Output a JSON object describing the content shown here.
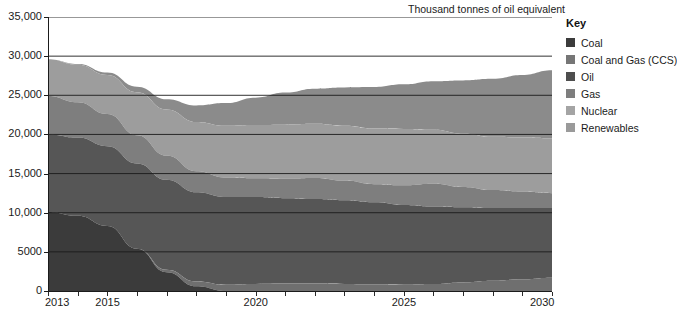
{
  "chart_data": {
    "type": "area",
    "stacked": true,
    "title": "Thousand tonnes of oil equivalent",
    "xlabel": "",
    "ylabel": "",
    "xlim": [
      2013,
      2030
    ],
    "ylim": [
      0,
      35000
    ],
    "ytick_labels": [
      "0",
      "5000",
      "10,000",
      "15,000",
      "20,000",
      "25,000",
      "30,000",
      "35,000"
    ],
    "ytick_values": [
      0,
      5000,
      10000,
      15000,
      20000,
      25000,
      30000,
      35000
    ],
    "xtick_labels": [
      "2013",
      "2015",
      "2020",
      "2025",
      "2030"
    ],
    "xtick_values": [
      2013,
      2015,
      2020,
      2025,
      2030
    ],
    "grid": true,
    "legend_position": "right",
    "legend_title": "Key",
    "x": [
      2013,
      2014,
      2015,
      2016,
      2017,
      2018,
      2019,
      2020,
      2021,
      2022,
      2023,
      2024,
      2025,
      2026,
      2027,
      2028,
      2029,
      2030
    ],
    "series": [
      {
        "name": "Coal",
        "color": "#3b3b3b",
        "values": [
          10100,
          9600,
          8300,
          5400,
          2400,
          600,
          0,
          0,
          0,
          0,
          0,
          0,
          0,
          0,
          0,
          0,
          0,
          0
        ]
      },
      {
        "name": "Coal and Gas (CCS)",
        "color": "#6f6f6f",
        "values": [
          0,
          0,
          0,
          0,
          300,
          600,
          800,
          900,
          950,
          950,
          900,
          850,
          800,
          900,
          1100,
          1300,
          1500,
          1700
        ]
      },
      {
        "name": "Oil",
        "color": "#565656",
        "values": [
          9900,
          10000,
          10200,
          10900,
          11500,
          11400,
          11200,
          11100,
          10900,
          10800,
          10700,
          10500,
          10200,
          9900,
          9600,
          9300,
          9100,
          8900
        ]
      },
      {
        "name": "Gas",
        "color": "#7e7e7e",
        "values": [
          4900,
          4500,
          4100,
          3600,
          3100,
          2700,
          2500,
          2400,
          2500,
          2700,
          2500,
          2300,
          2500,
          2900,
          2600,
          2300,
          2100,
          1900
        ]
      },
      {
        "name": "Nuclear",
        "color": "#9d9d9d",
        "values": [
          4700,
          4800,
          5000,
          5500,
          5900,
          6300,
          6600,
          6800,
          6900,
          6900,
          7000,
          7100,
          7200,
          6900,
          6800,
          6800,
          6900,
          7000
        ]
      },
      {
        "name": "Renewables",
        "color": "#8b8b8b",
        "values": [
          0,
          100,
          300,
          700,
          1300,
          2100,
          2900,
          3500,
          4100,
          4500,
          4900,
          5300,
          5700,
          6200,
          6800,
          7400,
          8000,
          8700
        ]
      }
    ],
    "totals": [
      29600,
      29000,
      27900,
      26100,
      24500,
      23700,
      24000,
      24700,
      25350,
      25850,
      26000,
      26050,
      26400,
      26800,
      26900,
      27100,
      27600,
      28200
    ]
  },
  "legend": {
    "title": "Key",
    "items": [
      {
        "label": "Coal",
        "color": "#3b3b3b"
      },
      {
        "label": "Coal and Gas (CCS)",
        "color": "#767676"
      },
      {
        "label": "Oil",
        "color": "#4e4e4e"
      },
      {
        "label": "Gas",
        "color": "#7e7e7e"
      },
      {
        "label": "Nuclear",
        "color": "#a4a4a4"
      },
      {
        "label": "Renewables",
        "color": "#9a9a9a"
      }
    ]
  }
}
